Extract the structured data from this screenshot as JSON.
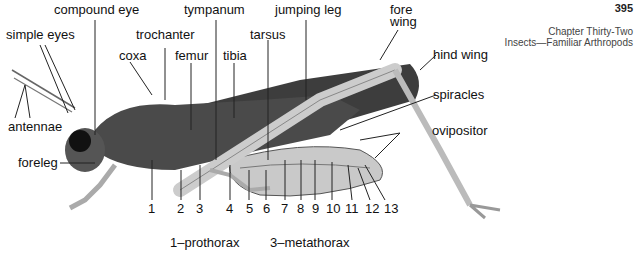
{
  "header": {
    "page_number": "395",
    "chapter": "Chapter Thirty-Two",
    "chapter_title": "Insects—Familiar Arthropods"
  },
  "labels": {
    "compound_eye": "compound eye",
    "simple_eyes": "simple eyes",
    "antennae": "antennae",
    "coxa": "coxa",
    "trochanter": "trochanter",
    "femur": "femur",
    "tympanum": "tympanum",
    "tibia": "tibia",
    "tarsus": "tarsus",
    "jumping_leg": "jumping leg",
    "fore_wing_1": "fore",
    "fore_wing_2": "wing",
    "hind_wing": "hind wing",
    "spiracles": "spiracles",
    "ovipositor": "ovipositor",
    "foreleg": "foreleg"
  },
  "segment_numbers": [
    "1",
    "2",
    "3",
    "4",
    "5",
    "6",
    "7",
    "8",
    "9",
    "10",
    "11",
    "12",
    "13"
  ],
  "legend": {
    "item1": "1–prothorax",
    "item2": "3–metathorax"
  }
}
